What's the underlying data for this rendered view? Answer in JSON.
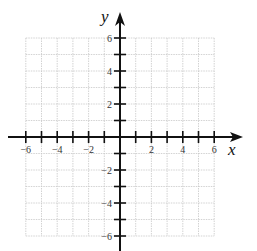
{
  "chart_data": {
    "type": "coordinate-plane",
    "title": "",
    "xlabel": "x",
    "ylabel": "y",
    "xlim": [
      -6,
      6
    ],
    "ylim": [
      -6,
      6
    ],
    "grid": true,
    "grid_step": 1,
    "x_tick_labels": [
      "-6",
      "-4",
      "-2",
      "2",
      "4",
      "6"
    ],
    "y_tick_labels": [
      "6",
      "4",
      "2",
      "-2",
      "-4",
      "-6"
    ],
    "x_tick_values": [
      -6,
      -4,
      -2,
      2,
      4,
      6
    ],
    "y_tick_values": [
      6,
      4,
      2,
      -2,
      -4,
      -6
    ],
    "series": []
  },
  "axes": {
    "x_label": "x",
    "y_label": "y"
  },
  "colors": {
    "axis": "#111111",
    "grid": "#c8c8c8",
    "label": "#333333"
  }
}
